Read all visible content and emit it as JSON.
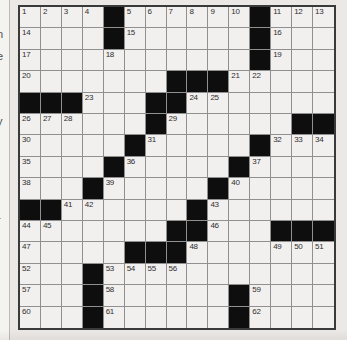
{
  "puzzle": {
    "kind": "crossword",
    "rows": 15,
    "cols": 15,
    "colors": {
      "page_bg": "#ebe8e5",
      "cell_bg": "#f2f0ee",
      "black_cell": "#0e0e0e",
      "grid_line": "#909090",
      "outer_border": "#3a3a3a",
      "number_text": "#2e2e2e"
    },
    "grid": [
      [
        "1",
        "2",
        "3",
        "4",
        "B",
        "5",
        "6",
        "7",
        "8",
        "9",
        "10",
        "B",
        "11",
        "12",
        "13"
      ],
      [
        "14",
        "",
        "",
        "",
        "B",
        "15",
        "",
        "",
        "",
        "",
        "",
        "B",
        "16",
        "",
        ""
      ],
      [
        "17",
        "",
        "",
        "",
        "18",
        "",
        "",
        "",
        "",
        "",
        "",
        "B",
        "19",
        "",
        ""
      ],
      [
        "20",
        "",
        "",
        "",
        "",
        "",
        "",
        "B",
        "B",
        "B",
        "21",
        "22",
        "",
        "",
        ""
      ],
      [
        "B",
        "B",
        "B",
        "23",
        "",
        "",
        "B",
        "B",
        "24",
        "25",
        "",
        "",
        "",
        "",
        ""
      ],
      [
        "26",
        "27",
        "28",
        "",
        "",
        "",
        "B",
        "29",
        "",
        "",
        "",
        "",
        "",
        "B",
        "B"
      ],
      [
        "30",
        "",
        "",
        "",
        "",
        "B",
        "31",
        "",
        "",
        "",
        "",
        "B",
        "32",
        "33",
        "34"
      ],
      [
        "35",
        "",
        "",
        "",
        "B",
        "36",
        "",
        "",
        "",
        "",
        "B",
        "37",
        "",
        "",
        ""
      ],
      [
        "38",
        "",
        "",
        "B",
        "39",
        "",
        "",
        "",
        "",
        "B",
        "40",
        "",
        "",
        "",
        ""
      ],
      [
        "B",
        "B",
        "41",
        "42",
        "",
        "",
        "",
        "",
        "B",
        "43",
        "",
        "",
        "",
        "",
        ""
      ],
      [
        "44",
        "45",
        "",
        "",
        "",
        "",
        "",
        "B",
        "B",
        "46",
        "",
        "",
        "B",
        "B",
        "B"
      ],
      [
        "47",
        "",
        "",
        "",
        "",
        "B",
        "B",
        "B",
        "48",
        "",
        "",
        "",
        "49",
        "50",
        "51"
      ],
      [
        "52",
        "",
        "",
        "B",
        "53",
        "54",
        "55",
        "56",
        "",
        "",
        "",
        "",
        "",
        "",
        ""
      ],
      [
        "57",
        "",
        "",
        "B",
        "58",
        "",
        "",
        "",
        "",
        "",
        "B",
        "59",
        "",
        "",
        ""
      ],
      [
        "60",
        "",
        "",
        "B",
        "61",
        "",
        "",
        "",
        "",
        "",
        "B",
        "62",
        "",
        "",
        ""
      ]
    ]
  },
  "clue_column_fragments": [
    {
      "text": "n",
      "y": 29
    },
    {
      "text": "e",
      "y": 51
    },
    {
      "text": "y",
      "y": 116
    },
    {
      "text": "r",
      "y": 215
    }
  ]
}
